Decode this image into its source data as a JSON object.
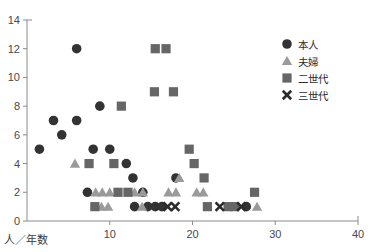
{
  "chart_data": {
    "type": "scatter",
    "title": "",
    "xlabel": "人／年数",
    "ylabel": "",
    "xlim": [
      0,
      40
    ],
    "ylim": [
      0,
      14
    ],
    "xticks": [
      10,
      20,
      30,
      40
    ],
    "yticks": [
      0,
      2,
      4,
      6,
      8,
      10,
      12,
      14
    ],
    "grid": false,
    "legend_position": "top-right",
    "series": [
      {
        "name": "本人",
        "marker": "circle",
        "color": "#333333",
        "points": [
          [
            1.5,
            5
          ],
          [
            3.2,
            7
          ],
          [
            4.2,
            6
          ],
          [
            6.0,
            7
          ],
          [
            6.0,
            12
          ],
          [
            8.0,
            5
          ],
          [
            8.8,
            8
          ],
          [
            10.0,
            5
          ],
          [
            7.3,
            2
          ],
          [
            12.0,
            4
          ],
          [
            12.8,
            3
          ],
          [
            14.0,
            2
          ],
          [
            13.0,
            1
          ],
          [
            14.6,
            1
          ],
          [
            15.5,
            1
          ],
          [
            16.3,
            1
          ],
          [
            18.0,
            3
          ],
          [
            26.5,
            1
          ]
        ]
      },
      {
        "name": "夫婦",
        "marker": "triangle",
        "color": "#9a9a9a",
        "points": [
          [
            5.8,
            4
          ],
          [
            8.3,
            2
          ],
          [
            9.1,
            2
          ],
          [
            10.0,
            2
          ],
          [
            13.9,
            1
          ],
          [
            9.0,
            1
          ],
          [
            9.8,
            1
          ],
          [
            13.0,
            2
          ],
          [
            14.0,
            2
          ],
          [
            18.4,
            3
          ],
          [
            17.1,
            2
          ],
          [
            18.0,
            2
          ],
          [
            20.5,
            2
          ],
          [
            21.3,
            2
          ],
          [
            27.8,
            1
          ]
        ]
      },
      {
        "name": "二世代",
        "marker": "square",
        "color": "#666666",
        "points": [
          [
            7.5,
            4
          ],
          [
            10.5,
            4
          ],
          [
            11.4,
            8
          ],
          [
            15.5,
            12
          ],
          [
            16.8,
            12
          ],
          [
            15.4,
            9
          ],
          [
            17.7,
            9
          ],
          [
            11.0,
            2
          ],
          [
            12.2,
            2
          ],
          [
            8.2,
            1
          ],
          [
            19.6,
            5
          ],
          [
            20.2,
            4
          ],
          [
            21.4,
            3
          ],
          [
            21.8,
            1
          ],
          [
            24.3,
            1
          ],
          [
            25.1,
            1
          ],
          [
            27.5,
            2
          ]
        ]
      },
      {
        "name": "三世代",
        "marker": "x",
        "color": "#2b2b2b",
        "points": [
          [
            17.0,
            1
          ],
          [
            17.9,
            1
          ],
          [
            23.3,
            1
          ],
          [
            25.9,
            1
          ]
        ]
      }
    ]
  },
  "legend": {
    "items": [
      {
        "label": "本人",
        "marker": "circle",
        "color": "#333333"
      },
      {
        "label": "夫婦",
        "marker": "triangle",
        "color": "#9a9a9a"
      },
      {
        "label": "二世代",
        "marker": "square",
        "color": "#666666"
      },
      {
        "label": "三世代",
        "marker": "x",
        "color": "#2b2b2b"
      }
    ]
  },
  "axes": {
    "x_tick_labels": [
      "10",
      "20",
      "30",
      "40"
    ],
    "y_tick_labels": [
      "0",
      "2",
      "4",
      "6",
      "8",
      "10",
      "12",
      "14"
    ],
    "x_axis_title": "人／年数"
  }
}
